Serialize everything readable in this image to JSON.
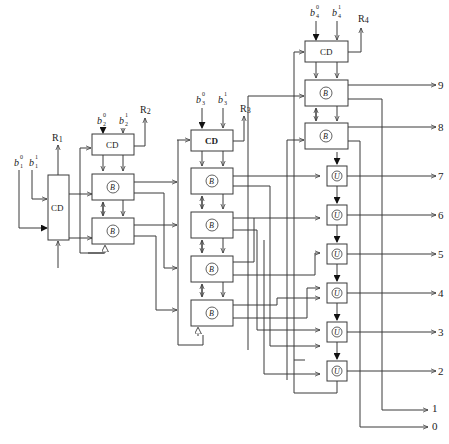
{
  "diagram": {
    "type": "logic-circuit-block-diagram",
    "stages": [
      {
        "id": "stage1",
        "cd_label": "CD",
        "inputs": [
          {
            "base": "b",
            "sub": "1",
            "sup": "0"
          },
          {
            "base": "b",
            "sub": "1",
            "sup": "1"
          }
        ],
        "result_label": "R1",
        "b_cells": 2,
        "b_symbol": "B"
      },
      {
        "id": "stage2",
        "cd_label": "CD",
        "inputs": [
          {
            "base": "b",
            "sub": "2",
            "sup": "0"
          },
          {
            "base": "b",
            "sub": "2",
            "sup": "1"
          }
        ],
        "result_label": "R2",
        "b_cells": 2,
        "b_symbol": "B"
      },
      {
        "id": "stage3",
        "cd_label": "CD",
        "inputs": [
          {
            "base": "b",
            "sub": "3",
            "sup": "0"
          },
          {
            "base": "b",
            "sub": "3",
            "sup": "1"
          }
        ],
        "result_label": "R3",
        "b_cells": 4,
        "b_symbol": "B"
      },
      {
        "id": "stage4",
        "cd_label": "CD",
        "inputs": [
          {
            "base": "b",
            "sub": "4",
            "sup": "0"
          },
          {
            "base": "b",
            "sub": "4",
            "sup": "1"
          }
        ],
        "result_label": "R4",
        "b_cells": 2,
        "b_symbol": "B",
        "u_cells": 6,
        "u_symbol": "U"
      }
    ],
    "outputs": [
      "9",
      "8",
      "7",
      "6",
      "5",
      "4",
      "3",
      "2",
      "1",
      "0"
    ]
  }
}
